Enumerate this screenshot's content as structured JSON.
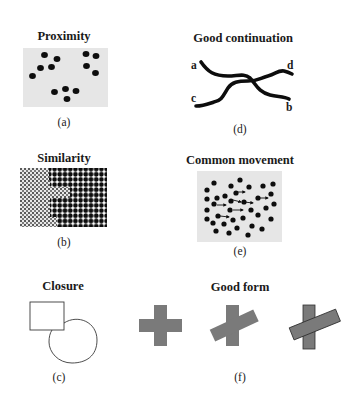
{
  "panels": {
    "a": {
      "title": "Proximity",
      "caption": "(a)"
    },
    "b": {
      "title": "Similarity",
      "caption": "(b)"
    },
    "c": {
      "title": "Closure",
      "caption": "(c)"
    },
    "d": {
      "title": "Good continuation",
      "caption": "(d)",
      "line_labels": {
        "a": "a",
        "b": "b",
        "c": "c",
        "d": "d"
      }
    },
    "e": {
      "title": "Common movement",
      "caption": "(e)"
    },
    "f": {
      "title": "Good form",
      "caption": "(f)"
    }
  },
  "colors": {
    "panel_bg": "#e6e6e6",
    "dot": "#0d0d0d",
    "shape_gray": "#7a7a7a",
    "shape_outline": "#3a3a3a"
  }
}
